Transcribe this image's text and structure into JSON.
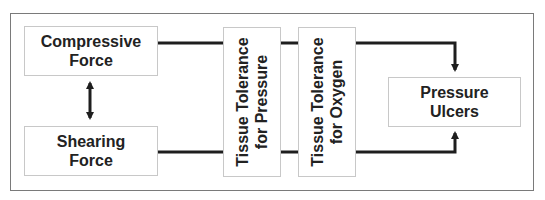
{
  "diagram": {
    "nodes": {
      "compressive_force": {
        "lines": [
          "Compressive",
          "Force"
        ]
      },
      "shearing_force": {
        "lines": [
          "Shearing",
          "Force"
        ]
      },
      "tissue_tolerance_pressure": {
        "lines": [
          "Tissue Tolerance",
          "for Pressure"
        ]
      },
      "tissue_tolerance_oxygen": {
        "lines": [
          "Tissue Tolerance",
          "for Oxygen"
        ]
      },
      "pressure_ulcers": {
        "lines": [
          "Pressure",
          "Ulcers"
        ]
      }
    },
    "edges": [
      {
        "from": "compressive_force",
        "to": "shearing_force",
        "type": "bidirectional-arrow"
      },
      {
        "from": "compressive_force",
        "to": "pressure_ulcers",
        "via": [
          "tissue_tolerance_pressure",
          "tissue_tolerance_oxygen"
        ],
        "type": "arrow"
      },
      {
        "from": "shearing_force",
        "to": "pressure_ulcers",
        "via": [
          "tissue_tolerance_pressure",
          "tissue_tolerance_oxygen"
        ],
        "type": "arrow"
      }
    ],
    "colors": {
      "line": "#1e1e1e",
      "box_border": "#c8c8c8",
      "frame_border": "#7a7a7a",
      "text": "#222222"
    }
  }
}
